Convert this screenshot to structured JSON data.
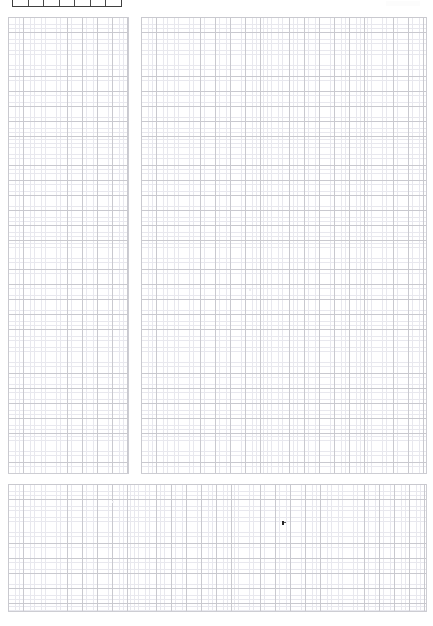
{
  "page": {
    "background_color": "#ffffff",
    "width": 433,
    "height": 626
  },
  "top_table": {
    "name": "clipped-header-table",
    "border_color": "#3f3f3f",
    "clipped_by_viewport_top": true,
    "columns": 7,
    "cells": [
      "",
      "",
      "",
      "",
      "",
      "",
      ""
    ]
  },
  "panels": [
    {
      "id": "panel-left",
      "label": "Left grid panel",
      "content": "",
      "grid": {
        "minor_pitch_px": 3.7,
        "major_every_n_minor": 4,
        "minor_color": "#e8e8ee",
        "major_color": "#c9c9cf"
      }
    },
    {
      "id": "panel-right",
      "label": "Right grid panel",
      "content": "",
      "grid": {
        "minor_pitch_px": 3.7,
        "major_every_n_minor": 4,
        "minor_color": "#e8e8ee",
        "major_color": "#c9c9cf"
      }
    },
    {
      "id": "panel-bottom",
      "label": "Bottom grid panel",
      "content": "",
      "grid": {
        "minor_pitch_px": 3.7,
        "major_every_n_minor": 4,
        "minor_color": "#e8e8ee",
        "major_color": "#c9c9cf"
      }
    }
  ],
  "markers": {
    "cursor": {
      "label": "Text cursor",
      "x": 283,
      "y": 523,
      "color": "#262626"
    }
  }
}
